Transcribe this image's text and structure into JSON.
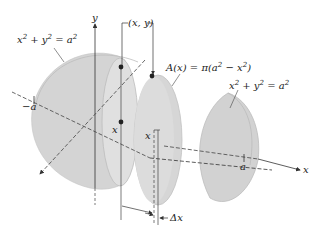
{
  "figure": {
    "colors": {
      "solid_fill": "#d4d4d4",
      "solid_fill_light": "#e2e2e2",
      "solid_edge": "#b8b8b8",
      "axis": "#333333",
      "point": "#222222"
    },
    "labels": {
      "y_axis": "y",
      "x_axis": "x",
      "neg_a": "−a",
      "pos_a": "a",
      "point": "(x, y)",
      "area_formula": "A(x) = π(a² − x²)",
      "circle_left": "x² + y² = a²",
      "circle_right": "x² + y² = a²",
      "x_marker_1": "x",
      "x_marker_2": "x",
      "delta_x": "Δx"
    },
    "circle_eq": {
      "base": "x",
      "exp": "2",
      "plus": " + y",
      "eq": " = a"
    },
    "area_eq": {
      "pre": "A(x) = π(a",
      "mid": " − x",
      "post": ")"
    }
  }
}
